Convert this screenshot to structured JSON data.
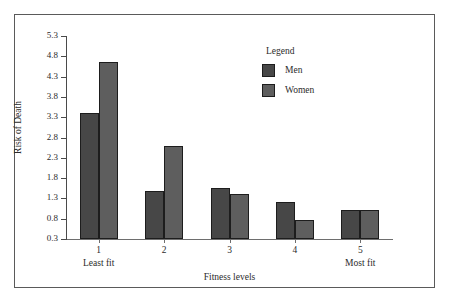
{
  "chart_data": {
    "type": "bar",
    "title": "",
    "xlabel": "Fitness levels",
    "ylabel": "Risk of Death",
    "categories": [
      "1",
      "2",
      "3",
      "4",
      "5"
    ],
    "category_sublabels": [
      "Least fit",
      "",
      "",
      "",
      "Most fit"
    ],
    "series": [
      {
        "name": "Men",
        "values": [
          3.4,
          1.47,
          1.55,
          1.22,
          1.02
        ],
        "color": "#474747"
      },
      {
        "name": "Women",
        "values": [
          4.65,
          2.58,
          1.41,
          0.77,
          1.02
        ],
        "color": "#5e5e5e"
      }
    ],
    "ylim": [
      0.3,
      5.3
    ],
    "yticks": [
      "0.3",
      "0.8",
      "1.3",
      "1.8",
      "2.3",
      "2.8",
      "3.3",
      "3.8",
      "4.3",
      "4.8",
      "5.3"
    ],
    "ytick_values": [
      0.3,
      0.8,
      1.3,
      1.8,
      2.3,
      2.8,
      3.3,
      3.8,
      4.3,
      4.8,
      5.3
    ],
    "grid": false,
    "legend_position": "inside-top-right",
    "legend_title": "Legend"
  },
  "legend": {
    "title": "Legend",
    "entries": [
      {
        "label": "Men",
        "color": "#474747"
      },
      {
        "label": "Women",
        "color": "#5e5e5e"
      }
    ]
  },
  "axes": {
    "x_title": "Fitness levels",
    "y_title": "Risk of Death"
  },
  "colors": {
    "men": "#474747",
    "women": "#5e5e5e",
    "frame": "#5a5a5a",
    "axis": "#4a4a4a",
    "background": "#ffffff"
  }
}
